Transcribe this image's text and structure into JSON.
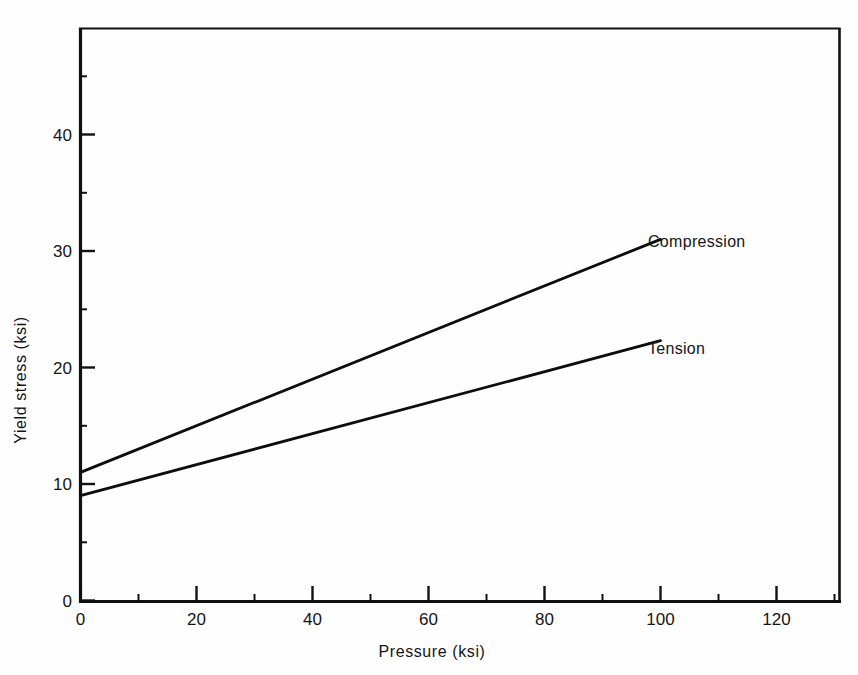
{
  "figure": {
    "top_caption_fragment": "",
    "background_color": "#fefefe",
    "ink_color": "#111111"
  },
  "chart_data": {
    "type": "line",
    "title": "",
    "xlabel": "Pressure  (ksi)",
    "ylabel": "Yield stress  (ksi)",
    "xlim": [
      0,
      131
    ],
    "ylim": [
      0,
      49
    ],
    "xticks": [
      0,
      20,
      40,
      60,
      80,
      100,
      120
    ],
    "xtick_labels": [
      "0",
      "20",
      "40",
      "60",
      "80",
      "100",
      "120"
    ],
    "yticks": [
      0,
      10,
      20,
      30,
      40
    ],
    "ytick_labels": [
      "0",
      "10",
      "20",
      "30",
      "40"
    ],
    "x_minor_ticks": [
      10,
      30,
      50,
      70,
      90,
      110,
      130
    ],
    "y_minor_ticks": [
      5,
      15,
      25,
      35,
      45
    ],
    "grid": false,
    "legend_position": "inline-right-of-line-ends",
    "series": [
      {
        "name": "Compression",
        "label": "Compression",
        "color": "#0d0d0d",
        "x": [
          0,
          100
        ],
        "values": [
          11.0,
          31.0
        ],
        "label_anchor": {
          "x": 103,
          "y": 31.0
        }
      },
      {
        "name": "Tension",
        "label": "Tension",
        "color": "#0d0d0d",
        "x": [
          0,
          100
        ],
        "values": [
          9.0,
          22.3
        ],
        "label_anchor": {
          "x": 103,
          "y": 22.3
        }
      }
    ]
  }
}
